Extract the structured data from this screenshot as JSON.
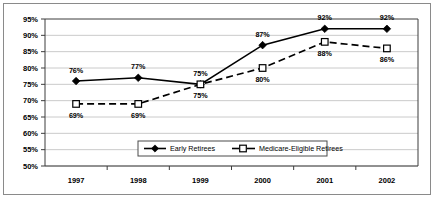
{
  "chart_data": {
    "type": "line",
    "title": "",
    "subtitle": "",
    "xlabel": "",
    "ylabel": "",
    "categories": [
      "1997",
      "1998",
      "1999",
      "2000",
      "2001",
      "2002"
    ],
    "ylim": [
      50,
      95
    ],
    "y_ticks": [
      "50%",
      "55%",
      "60%",
      "65%",
      "70%",
      "75%",
      "80%",
      "85%",
      "90%",
      "95%"
    ],
    "y_tick_values": [
      50,
      55,
      60,
      65,
      70,
      75,
      80,
      85,
      90,
      95
    ],
    "grid": true,
    "legend_position": "bottom-center",
    "series": [
      {
        "name": "Early Retirees",
        "marker": "filled-diamond",
        "line_style": "solid",
        "color": "#000000",
        "values": [
          76,
          77,
          75,
          87,
          92,
          92
        ],
        "labels": [
          "76%",
          "77%",
          "75%",
          "87%",
          "92%",
          "92%"
        ],
        "label_positions": [
          "above",
          "above",
          "above",
          "above",
          "above",
          "above"
        ]
      },
      {
        "name": "Medicare-Eligible Retirees",
        "marker": "hollow-square",
        "line_style": "dashed",
        "color": "#000000",
        "values": [
          69,
          69,
          75,
          80,
          88,
          86
        ],
        "labels": [
          "69%",
          "69%",
          "75%",
          "80%",
          "88%",
          "86%"
        ],
        "label_positions": [
          "below",
          "below",
          "below",
          "below",
          "below",
          "below"
        ]
      }
    ]
  },
  "legend": {
    "entries": [
      {
        "label": "Early Retirees",
        "marker": "filled-diamond",
        "line_style": "solid"
      },
      {
        "label": "Medicare-Eligible Retirees",
        "marker": "hollow-square",
        "line_style": "dashed"
      }
    ]
  },
  "colors": {
    "background": "#ffffff",
    "gridline": "#bdbdbd",
    "axis": "#3d3d3d",
    "outer_border": "#8a8a8a",
    "series_line": "#000000"
  }
}
